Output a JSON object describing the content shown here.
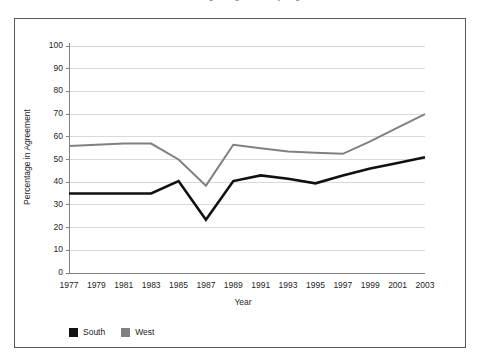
{
  "figure": {
    "title_cropped": "Percentage in Agreement by Region",
    "border_color": "#595959",
    "background": "#ffffff"
  },
  "chart_data": {
    "type": "line",
    "title": "",
    "xlabel": "Year",
    "ylabel": "Percentage in Agreement",
    "x": [
      1977,
      1979,
      1981,
      1983,
      1985,
      1987,
      1989,
      1991,
      1993,
      1995,
      1997,
      1999,
      2001,
      2003
    ],
    "categories": [
      "1977",
      "1979",
      "1981",
      "1983",
      "1985",
      "1987",
      "1989",
      "1991",
      "1993",
      "1995",
      "1997",
      "1999",
      "2001",
      "2003"
    ],
    "series": [
      {
        "name": "South",
        "color": "#111111",
        "linewidth": 2.6,
        "values": [
          35,
          35,
          35,
          35,
          40.5,
          23.5,
          40.5,
          43,
          41.5,
          39.5,
          43,
          46,
          48.5,
          51
        ]
      },
      {
        "name": "West",
        "color": "#808080",
        "linewidth": 2.0,
        "values": [
          56,
          56.5,
          57,
          57,
          50,
          38.5,
          56.5,
          55,
          53.5,
          53,
          52.5,
          58,
          64,
          70
        ]
      }
    ],
    "ylim": [
      0,
      100
    ],
    "yticks": [
      0,
      10,
      20,
      30,
      40,
      50,
      60,
      70,
      80,
      90,
      100
    ],
    "ytick_labels": [
      "0",
      "10",
      "20",
      "30",
      "40",
      "50",
      "60",
      "70",
      "80",
      "90",
      "100"
    ],
    "xlim": [
      1977,
      2003
    ],
    "xticks": [
      1977,
      1979,
      1981,
      1983,
      1985,
      1987,
      1989,
      1991,
      1993,
      1995,
      1997,
      1999,
      2001,
      2003
    ],
    "xtick_labels": [
      "1977",
      "1979",
      "1981",
      "1983",
      "1985",
      "1987",
      "1989",
      "1991",
      "1993",
      "1995",
      "1997",
      "1999",
      "2001",
      "2003"
    ],
    "grid": {
      "horizontal": true,
      "vertical": false,
      "color": "#d9d9d9"
    },
    "legend": {
      "position": "below-left",
      "entries": [
        {
          "label": "South",
          "color": "#111111"
        },
        {
          "label": "West",
          "color": "#808080"
        }
      ]
    },
    "axis_color": "#808080"
  }
}
